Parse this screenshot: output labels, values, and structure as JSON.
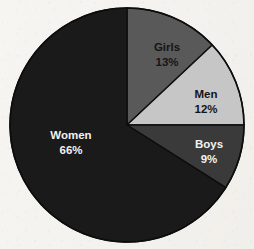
{
  "chart_data": {
    "type": "pie",
    "title": "",
    "subtitle": "",
    "xlabel": "",
    "ylabel": "",
    "legend_position": "none",
    "grid": false,
    "start_angle_deg": 0,
    "direction": "clockwise",
    "categories": [
      "Girls",
      "Men",
      "Boys",
      "Women"
    ],
    "values": [
      13,
      12,
      9,
      66
    ],
    "value_unit": "%",
    "slices": [
      {
        "label": "Girls",
        "value": 13,
        "value_label": "13%",
        "color": "#595959",
        "text_color": "#151515",
        "text_style": "dark",
        "start_deg": 0,
        "end_deg": 46.8,
        "label_x": 167,
        "label_y": 48
      },
      {
        "label": "Men",
        "value": 12,
        "value_label": "12%",
        "color": "#c6c6c6",
        "text_color": "#151515",
        "text_style": "dark",
        "start_deg": 46.8,
        "end_deg": 90,
        "label_x": 206,
        "label_y": 95
      },
      {
        "label": "Boys",
        "value": 9,
        "value_label": "9%",
        "color": "#3a3a3a",
        "text_color": "#f2f2f2",
        "text_style": "light",
        "start_deg": 90,
        "end_deg": 122.4,
        "label_x": 209,
        "label_y": 145
      },
      {
        "label": "Women",
        "value": 66,
        "value_label": "66%",
        "color": "#1a1a1a",
        "text_color": "#f2f2f2",
        "text_style": "light",
        "start_deg": 122.4,
        "end_deg": 360,
        "label_x": 71,
        "label_y": 136
      }
    ],
    "center_x": 127,
    "center_y": 125,
    "radius": 117,
    "outline_color": "#0d0d0d",
    "background_color": "#f4f2ee"
  }
}
